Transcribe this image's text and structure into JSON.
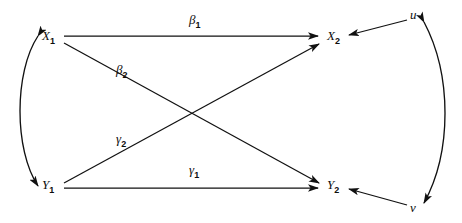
{
  "diagram": {
    "type": "path-diagram",
    "background_color": "#ffffff",
    "line_color": "#111111",
    "text_color": "#0d0d0d",
    "nodes": [
      {
        "id": "X1",
        "base": "X",
        "sub": "1",
        "x": 48,
        "y": 40
      },
      {
        "id": "X2",
        "base": "X",
        "sub": "2",
        "x": 333,
        "y": 40
      },
      {
        "id": "Y1",
        "base": "Y",
        "sub": "1",
        "x": 48,
        "y": 184
      },
      {
        "id": "Y2",
        "base": "Y",
        "sub": "2",
        "x": 333,
        "y": 184
      },
      {
        "id": "u",
        "base": "u",
        "sub": "",
        "x": 415,
        "y": 16
      },
      {
        "id": "v",
        "base": "v",
        "sub": "",
        "x": 415,
        "y": 209
      }
    ],
    "edges": [
      {
        "id": "beta1",
        "base": "β",
        "sub": "1",
        "from": "X1",
        "to": "X2",
        "label_x": 193,
        "label_y": 22,
        "kind": "straight",
        "arrow": "single"
      },
      {
        "id": "beta2",
        "base": "β",
        "sub": "2",
        "from": "X1",
        "to": "Y2",
        "label_x": 120,
        "label_y": 72,
        "kind": "straight",
        "arrow": "single"
      },
      {
        "id": "gamma2",
        "base": "γ",
        "sub": "2",
        "from": "Y1",
        "to": "X2",
        "label_x": 120,
        "label_y": 141,
        "kind": "straight",
        "arrow": "single"
      },
      {
        "id": "gamma1",
        "base": "γ",
        "sub": "1",
        "from": "Y1",
        "to": "Y2",
        "label_x": 193,
        "label_y": 172,
        "kind": "straight",
        "arrow": "single"
      },
      {
        "id": "u-to-X2",
        "base": "",
        "sub": "",
        "from": "u",
        "to": "X2",
        "label_x": 0,
        "label_y": 0,
        "kind": "straight",
        "arrow": "single"
      },
      {
        "id": "v-to-Y2",
        "base": "",
        "sub": "",
        "from": "v",
        "to": "Y2",
        "label_x": 0,
        "label_y": 0,
        "kind": "straight",
        "arrow": "single"
      },
      {
        "id": "X1-Y1-arc",
        "base": "",
        "sub": "",
        "from": "X1",
        "to": "Y1",
        "label_x": 0,
        "label_y": 0,
        "kind": "curved-left",
        "arrow": "double"
      },
      {
        "id": "u-v-arc",
        "base": "",
        "sub": "",
        "from": "u",
        "to": "v",
        "label_x": 0,
        "label_y": 0,
        "kind": "curved-right",
        "arrow": "double"
      }
    ]
  }
}
